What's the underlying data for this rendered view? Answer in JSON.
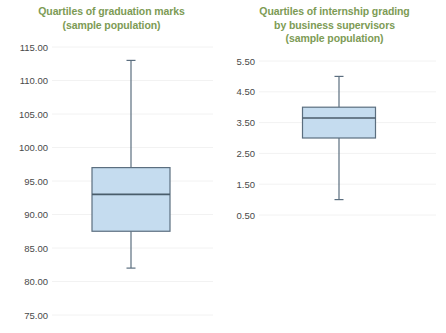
{
  "chart_data": [
    {
      "type": "box",
      "panel": "left",
      "title": "Quartiles of graduation marks (sample population)",
      "title_lines": [
        "Quartiles of graduation marks",
        "(sample population)"
      ],
      "xlabel": "",
      "ylabel": "",
      "ylim": [
        75.0,
        115.0
      ],
      "yticks": [
        115.0,
        110.0,
        105.0,
        100.0,
        95.0,
        90.0,
        85.0,
        80.0,
        75.0
      ],
      "ytick_labels": [
        "115.00",
        "110.00",
        "105.00",
        "100.00",
        "95.00",
        "90.00",
        "85.00",
        "80.00",
        "75.00"
      ],
      "grid": true,
      "legend": "none",
      "boxes": [
        {
          "name": "graduation marks",
          "whisker_low": 82.0,
          "q1": 87.5,
          "median": 93.0,
          "q3": 97.0,
          "whisker_high": 113.0
        }
      ]
    },
    {
      "type": "box",
      "panel": "right",
      "title": "Quartiles of internship grading by business supervisors (sample population)",
      "title_lines": [
        "Quartiles of internship grading",
        "by business supervisors",
        "(sample population)"
      ],
      "xlabel": "",
      "ylabel": "",
      "ylim": [
        0.5,
        5.5
      ],
      "yticks": [
        5.5,
        4.5,
        3.5,
        2.5,
        1.5,
        0.5
      ],
      "ytick_labels": [
        "5.50",
        "4.50",
        "3.50",
        "2.50",
        "1.50",
        "0.50"
      ],
      "grid": true,
      "legend": "none",
      "boxes": [
        {
          "name": "internship grading",
          "whisker_low": 1.0,
          "q1": 3.0,
          "median": 3.65,
          "q3": 4.0,
          "whisker_high": 5.0
        }
      ]
    }
  ],
  "colors": {
    "title": "#7d9b55",
    "box_fill": "#c5dcef",
    "box_border": "#5b6e7f",
    "median": "#4a5d6b",
    "gridline": "#f2f2f2",
    "tick_text": "#4a4a4a",
    "background": "#ffffff"
  }
}
